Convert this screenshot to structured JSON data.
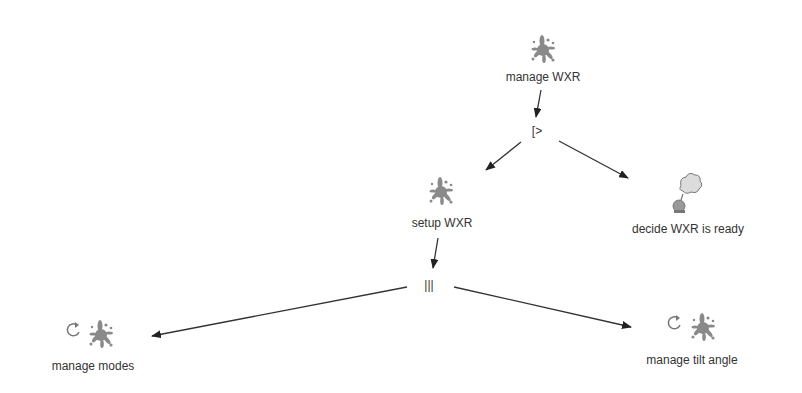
{
  "diagram": {
    "type": "task-model",
    "nodes": [
      {
        "id": "manage_wxr",
        "label": "manage WXR",
        "kind": "abstract",
        "iterative": false
      },
      {
        "id": "setup_wxr",
        "label": "setup WXR",
        "kind": "abstract",
        "iterative": false
      },
      {
        "id": "decide_wxr_ready",
        "label": "decide WXR is ready",
        "kind": "user",
        "iterative": false
      },
      {
        "id": "manage_modes",
        "label": "manage modes",
        "kind": "abstract",
        "iterative": true
      },
      {
        "id": "manage_tilt_angle",
        "label": "manage tilt angle",
        "kind": "abstract",
        "iterative": true
      }
    ],
    "operators": [
      {
        "id": "op_disable",
        "symbol": "[>",
        "name": "disabling"
      },
      {
        "id": "op_concurrent",
        "symbol": "|||",
        "name": "interleaving"
      }
    ],
    "edges": [
      {
        "from": "manage_wxr",
        "to": "op_disable"
      },
      {
        "from": "op_disable",
        "to": "setup_wxr"
      },
      {
        "from": "op_disable",
        "to": "decide_wxr_ready"
      },
      {
        "from": "setup_wxr",
        "to": "op_concurrent"
      },
      {
        "from": "op_concurrent",
        "to": "manage_modes"
      },
      {
        "from": "op_concurrent",
        "to": "manage_tilt_angle"
      }
    ],
    "icons": {
      "abstract": "splat-task-icon",
      "user": "thought-bubble-user-icon",
      "iterative": "loop-arrow-icon"
    },
    "colors": {
      "line": "#333333",
      "icon": "#8a8a8a",
      "text": "#333333",
      "background": "#ffffff"
    }
  }
}
